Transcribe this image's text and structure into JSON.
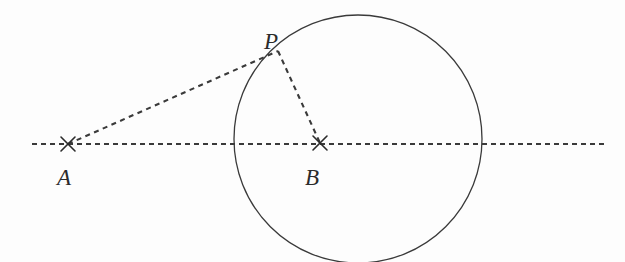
{
  "figure": {
    "width": 625,
    "height": 262,
    "background_color": "#fdfdfd",
    "stroke_color": "#3a3a3a",
    "label_color": "#2b2b2b"
  },
  "labels": {
    "A": "A",
    "B": "B",
    "P": "P"
  },
  "points": {
    "A": {
      "name": "A",
      "x": 68,
      "y": 144,
      "marker": "x-cross",
      "label_dx": -11,
      "label_dy": 22
    },
    "B": {
      "name": "B",
      "x": 320,
      "y": 143,
      "marker": "x-cross",
      "label_dx": -15,
      "label_dy": 23
    },
    "P": {
      "name": "P",
      "x": 278,
      "y": 51,
      "marker": "none",
      "label_dx": -14,
      "label_dy": -21
    }
  },
  "circle": {
    "name": "main-circle",
    "center_x": 358,
    "center_y": 139,
    "radius": 124,
    "stroke": "#3a3a3a",
    "stroke_width": 1.3,
    "style": "solid",
    "fill": "none"
  },
  "lines": {
    "horizontal_axis": {
      "name": "horizontal-dotted-axis",
      "x1": 32,
      "y1": 144,
      "x2": 604,
      "y2": 144,
      "style": "dotted",
      "dash_pattern": "5,4",
      "stroke": "#3a3a3a",
      "stroke_width": 2.1
    },
    "segment_AP": {
      "name": "segment-A-to-P",
      "x1": 68,
      "y1": 144,
      "x2": 278,
      "y2": 51,
      "style": "dotted",
      "dash_pattern": "5,4.5",
      "stroke": "#3a3a3a",
      "stroke_width": 2.1
    },
    "segment_PB": {
      "name": "segment-P-to-B",
      "x1": 278,
      "y1": 51,
      "x2": 320,
      "y2": 143,
      "style": "dotted",
      "dash_pattern": "5,4.5",
      "stroke": "#3a3a3a",
      "stroke_width": 2.1
    }
  },
  "markers": {
    "cross_arm_length": 7,
    "cross_stroke_width": 1.6,
    "cross_stroke": "#2b2b2b"
  }
}
